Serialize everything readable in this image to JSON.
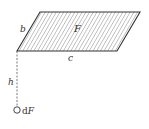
{
  "diagram": {
    "labels": {
      "area": "F",
      "side_slant": "b",
      "side_base": "c",
      "height": "h",
      "point_prefix": "d",
      "point_var": "F"
    },
    "shape": {
      "type": "parallelogram",
      "fill": "hatched",
      "vertices": [
        [
          17,
          51
        ],
        [
          40,
          12
        ],
        [
          140,
          12
        ],
        [
          117,
          51
        ]
      ]
    },
    "colors": {
      "stroke": "#333333",
      "hatch": "#777777",
      "background": "#ffffff"
    }
  }
}
